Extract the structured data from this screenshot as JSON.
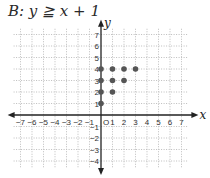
{
  "title": "B: y ≧ x + 1",
  "chart_data": {
    "type": "scatter",
    "title": "B: y ≧ x + 1",
    "xlabel": "x",
    "ylabel": "y",
    "xlim": [
      -7,
      7
    ],
    "ylim": [
      -4,
      7
    ],
    "grid": true,
    "x_ticks": [
      -7,
      -6,
      -5,
      -4,
      -3,
      -2,
      -1,
      1,
      2,
      3,
      4,
      5,
      6,
      7
    ],
    "y_ticks": [
      -4,
      -3,
      -2,
      -1,
      1,
      2,
      3,
      4,
      5,
      6,
      7
    ],
    "origin_label": "O",
    "points": [
      {
        "x": 0,
        "y": 1
      },
      {
        "x": 0,
        "y": 2
      },
      {
        "x": 1,
        "y": 2
      },
      {
        "x": 0,
        "y": 3
      },
      {
        "x": 1,
        "y": 3
      },
      {
        "x": 2,
        "y": 3
      },
      {
        "x": 0,
        "y": 4
      },
      {
        "x": 1,
        "y": 4
      },
      {
        "x": 2,
        "y": 4
      },
      {
        "x": 3,
        "y": 4
      }
    ],
    "colors": {
      "point": "#555555",
      "grid": "#bdbdbd",
      "axis": "#222222"
    }
  }
}
